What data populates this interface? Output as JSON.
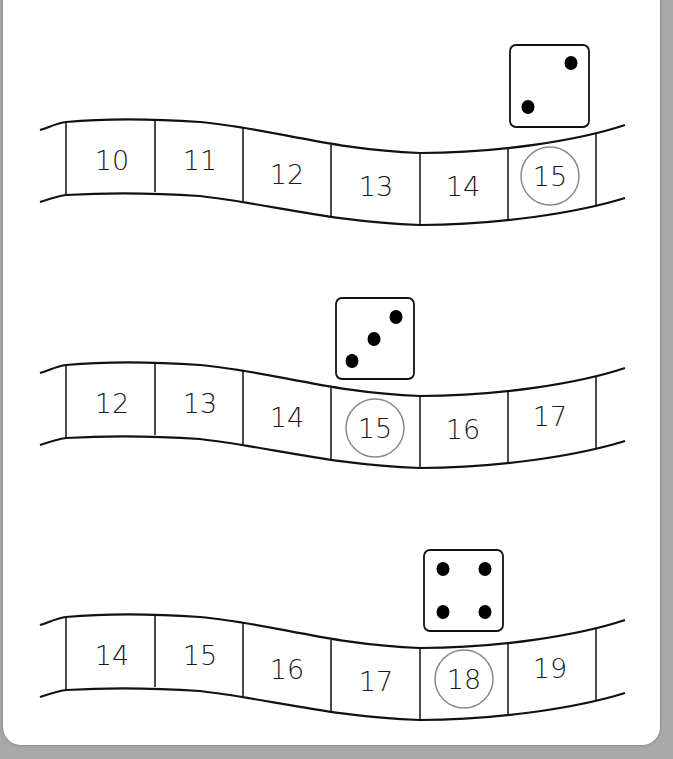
{
  "worksheet": {
    "colors": {
      "line": "#111111",
      "circle": "#888888",
      "pip": "#000000",
      "background": "#a9a9a9",
      "card": "#ffffff"
    },
    "rows": [
      {
        "numbers": [
          "10",
          "11",
          "12",
          "13",
          "14",
          "15"
        ],
        "die_value": 2,
        "circled": "15",
        "circled_index": 5
      },
      {
        "numbers": [
          "12",
          "13",
          "14",
          "15",
          "16",
          "17"
        ],
        "die_value": 3,
        "circled": "15",
        "circled_index": 3
      },
      {
        "numbers": [
          "14",
          "15",
          "16",
          "17",
          "18",
          "19"
        ],
        "die_value": 4,
        "circled": "18",
        "circled_index": 4
      }
    ]
  }
}
